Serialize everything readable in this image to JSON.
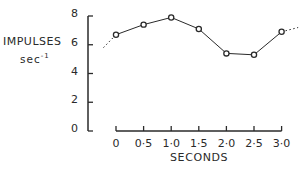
{
  "chart_data": {
    "type": "line",
    "title": "",
    "xlabel": "SECONDS",
    "ylabel": "IMPULSES sec-1",
    "ylabel_line1": "IMPULSES",
    "ylabel_line2_base": "sec",
    "ylabel_line2_exp": "-1",
    "x": [
      0,
      0.5,
      1.0,
      1.5,
      2.0,
      2.5,
      3.0
    ],
    "x_tick_labels": [
      "0",
      "0·5",
      "1·0",
      "1·5",
      "2·0",
      "2·5",
      "3·0"
    ],
    "y_ticks": [
      0,
      2,
      4,
      6,
      8
    ],
    "y_tick_labels": [
      "0",
      "2",
      "4",
      "6",
      "8"
    ],
    "series": [
      {
        "name": "impulses",
        "values": [
          6.7,
          7.4,
          7.9,
          7.1,
          5.4,
          5.3,
          6.9
        ],
        "marker": "open-circle",
        "line": "solid"
      }
    ],
    "extrapolation": {
      "left": {
        "x": -0.3,
        "y": 5.8,
        "style": "dotted"
      },
      "right": {
        "x": 3.3,
        "y": 7.2,
        "style": "dotted"
      }
    },
    "xlim": [
      0,
      3.0
    ],
    "ylim": [
      0,
      8
    ],
    "grid": false,
    "legend": null
  },
  "colors": {
    "ink": "#2a2a2a",
    "background": "#ffffff"
  }
}
